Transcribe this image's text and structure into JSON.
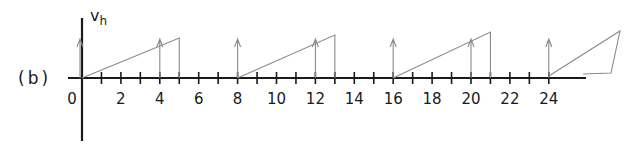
{
  "panel_label": "(b)",
  "y_axis": {
    "label": "v",
    "subscript": "h"
  },
  "x_axis": {
    "origin_label": "0",
    "tick_labels": [
      "2",
      "4",
      "6",
      "8",
      "10",
      "12",
      "14",
      "16",
      "18",
      "20",
      "22",
      "24"
    ],
    "minor_ticks": [
      1,
      2,
      3,
      4,
      5,
      6,
      7,
      8,
      9,
      10,
      11,
      12,
      13,
      14,
      15,
      16,
      17,
      18,
      19,
      20,
      21,
      22,
      23,
      24
    ],
    "range": [
      0,
      26
    ]
  },
  "impulses_at": [
    0,
    4,
    8,
    12,
    16,
    20,
    24
  ],
  "ramps": [
    {
      "start": 0,
      "end": 5
    },
    {
      "start": 8,
      "end": 13
    },
    {
      "start": 16,
      "end": 21
    },
    {
      "start": 24,
      "end": 27.5
    }
  ],
  "colors": {
    "axis": "#1a1a1a",
    "sketch": "#8a8a8a"
  }
}
